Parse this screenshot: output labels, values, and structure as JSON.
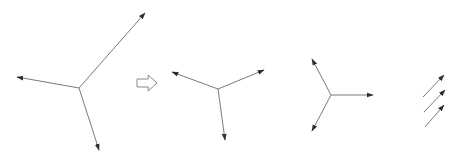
{
  "diagram": {
    "colors": {
      "background": "#ffffff",
      "line": "#7a7a7a",
      "arrowhead": "#2e2e2e",
      "transition_arrow_stroke": "#8a8a8a"
    },
    "figures": [
      {
        "id": "figure-1",
        "label": "three-vector star (large)",
        "origin": [
          79,
          88
        ],
        "vectors": [
          {
            "name": "upper-right",
            "tip": [
              145,
              13
            ]
          },
          {
            "name": "left",
            "tip": [
              17,
              77
            ]
          },
          {
            "name": "down",
            "tip": [
              99,
              150
            ]
          }
        ]
      },
      {
        "id": "transition-arrow",
        "label": "implies / transforms to",
        "shape": "hollow-right-arrow",
        "bbox": [
          137,
          75,
          157,
          91
        ]
      },
      {
        "id": "figure-2",
        "label": "three-vector star (reduced)",
        "origin": [
          218,
          89
        ],
        "vectors": [
          {
            "name": "upper-left",
            "tip": [
              172,
              72
            ]
          },
          {
            "name": "upper-right",
            "tip": [
              264,
              70
            ]
          },
          {
            "name": "down",
            "tip": [
              225,
              140
            ]
          }
        ]
      },
      {
        "id": "figure-3",
        "label": "three-vector star (symmetric)",
        "origin": [
          331,
          95
        ],
        "vectors": [
          {
            "name": "upper-left",
            "tip": [
              312,
              59
            ]
          },
          {
            "name": "right",
            "tip": [
              373,
              95
            ]
          },
          {
            "name": "lower-left",
            "tip": [
              312,
              131
            ]
          }
        ]
      },
      {
        "id": "figure-4",
        "label": "three parallel vectors",
        "vectors": [
          {
            "name": "top",
            "from": [
              423,
              97
            ],
            "tip": [
              444,
              75
            ]
          },
          {
            "name": "middle",
            "from": [
              424,
              112
            ],
            "tip": [
              445,
              90
            ]
          },
          {
            "name": "bottom",
            "from": [
              425,
              127
            ],
            "tip": [
              444,
              105
            ]
          }
        ]
      }
    ]
  }
}
